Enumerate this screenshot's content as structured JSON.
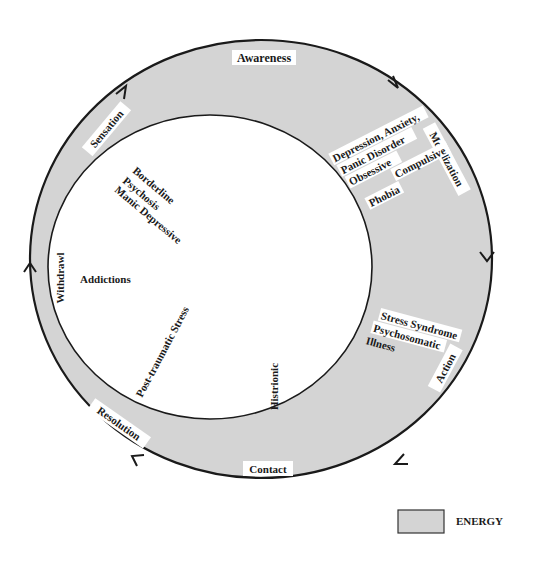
{
  "diagram": {
    "colors": {
      "energy_fill": "#d4d4d4",
      "stroke": "#1a1a1a",
      "inner_fill": "#ffffff",
      "label_bg": "#ffffff"
    },
    "cycle_stages": [
      {
        "id": "awareness",
        "label": "Awareness"
      },
      {
        "id": "mobilization",
        "label": "Mobilization"
      },
      {
        "id": "action",
        "label": "Action"
      },
      {
        "id": "contact",
        "label": "Contact"
      },
      {
        "id": "resolution",
        "label": "Resolution"
      },
      {
        "id": "withdrawl",
        "label": "Withdrawl"
      },
      {
        "id": "sensation",
        "label": "Sensation"
      }
    ],
    "disorders_ring": {
      "mobilization_group": [
        "Depression, Anxiety,",
        "Panic Disorder",
        "Obsessive",
        "Compulsive",
        "Phobia"
      ],
      "action_group": [
        "Stress Syndrome",
        "Psychosomatic",
        "Illness"
      ]
    },
    "disorders_inner": {
      "sensation_group": [
        "Borderline",
        "Psychosis",
        "Manic Depressive"
      ],
      "addictions": "Addictions",
      "post_traumatic": "Post-traumatic Stress",
      "histrionic": "Histrionic"
    },
    "legend": {
      "label": "ENERGY"
    }
  }
}
